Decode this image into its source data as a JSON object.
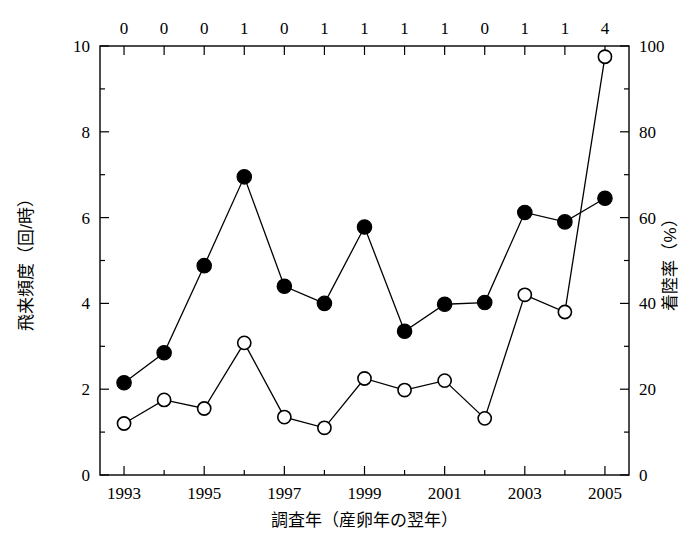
{
  "chart_data": {
    "type": "line",
    "title": "",
    "xlabel": "調査年（産卵年の翌年）",
    "ylabel_left": "飛来頻度（回/時）",
    "ylabel_right": "着陸率（%）",
    "x": [
      1993,
      1994,
      1995,
      1996,
      1997,
      1998,
      1999,
      2000,
      2001,
      2002,
      2003,
      2004,
      2005
    ],
    "xlim": [
      1992.4,
      2005.6
    ],
    "xticks": [
      1993,
      1995,
      1997,
      1999,
      2001,
      2003,
      2005
    ],
    "xticklabels": [
      "1993",
      "1995",
      "1997",
      "1999",
      "2001",
      "2003",
      "2005"
    ],
    "xticks_minor": [
      1994,
      1996,
      1998,
      2000,
      2002,
      2004
    ],
    "ylim_left": [
      0,
      10
    ],
    "yticks_left": [
      0,
      2,
      4,
      6,
      8,
      10
    ],
    "yticklabels_left": [
      "0",
      "2",
      "4",
      "6",
      "8",
      "10"
    ],
    "ylim_right": [
      0,
      100
    ],
    "yticks_right": [
      0,
      20,
      40,
      60,
      80,
      100
    ],
    "yticklabels_right": [
      "0",
      "20",
      "40",
      "60",
      "80",
      "100"
    ],
    "top_axis_labels": [
      "0",
      "0",
      "0",
      "1",
      "0",
      "1",
      "1",
      "1",
      "1",
      "0",
      "1",
      "1",
      "4"
    ],
    "grid": false,
    "legend": "none",
    "series": [
      {
        "name": "飛来頻度（回/時）",
        "marker": "filled-circle",
        "axis": "left",
        "values": [
          2.15,
          2.85,
          4.88,
          6.95,
          4.4,
          4.0,
          5.78,
          3.35,
          3.98,
          4.02,
          6.12,
          5.9,
          6.45
        ]
      },
      {
        "name": "着陸率（%）",
        "marker": "open-circle",
        "axis": "right",
        "values": [
          12.0,
          17.5,
          15.5,
          30.8,
          13.5,
          11.0,
          22.5,
          19.8,
          22.0,
          13.2,
          42.0,
          38.0,
          97.5
        ]
      }
    ],
    "colors": {
      "line": "#000000",
      "filled_marker": "#000000",
      "open_marker": "#ffffff",
      "background": "#ffffff"
    }
  }
}
